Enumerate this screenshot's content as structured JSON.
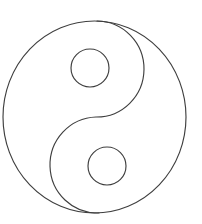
{
  "canvas": {
    "width": 202,
    "height": 224,
    "background_color": "#ffffff",
    "title": "Yin Yang Outline Drawing"
  },
  "figure": {
    "name": "taijitu",
    "style": "line-art-outline",
    "fill": "none",
    "stroke_color": "#3f3f3f",
    "stroke_width": 1.15,
    "outer_circle": {
      "center_x": 94.5,
      "center_y": 117,
      "radius_x": 91.5,
      "radius_y": 96,
      "left": 3,
      "right": 186,
      "top": 21,
      "bottom": 213
    },
    "s_curve": {
      "description": "double semicircular divider from top pole to bottom pole",
      "top_pole_x": 97,
      "top_pole_y": 21,
      "bottom_pole_x": 99,
      "bottom_pole_y": 213,
      "upper_arc": {
        "center_x": 90,
        "center_y": 68,
        "radius": 46,
        "bulge_direction": "right",
        "extreme_x": 134
      },
      "lower_arc": {
        "center_x": 104,
        "center_y": 166,
        "radius": 47,
        "bulge_direction": "left",
        "extreme_x": 58
      },
      "path": "M 97 21 A 46.5 47 0 0 1 96 117 A 47.5 48 0 0 0 99 213"
    },
    "small_circles": [
      {
        "label": "upper-eye",
        "center_x": 90,
        "center_y": 68,
        "radius": 19,
        "left": 71,
        "right": 109,
        "top": 49,
        "bottom": 87
      },
      {
        "label": "lower-eye",
        "center_x": 107,
        "center_y": 166,
        "radius": 19,
        "left": 88,
        "right": 126,
        "top": 147,
        "bottom": 185
      }
    ]
  }
}
